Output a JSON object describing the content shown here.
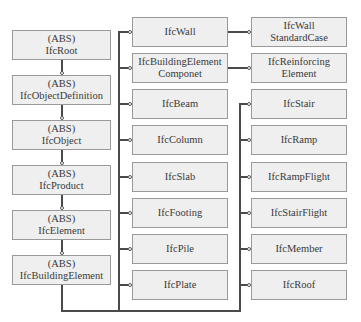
{
  "diagram": {
    "left_column": [
      {
        "tag": "(ABS)",
        "name": "IfcRoot"
      },
      {
        "tag": "(ABS)",
        "name": "IfcObjectDefinition"
      },
      {
        "tag": "(ABS)",
        "name": "IfcObject"
      },
      {
        "tag": "(ABS)",
        "name": "IfcProduct"
      },
      {
        "tag": "(ABS)",
        "name": "IfcElement"
      },
      {
        "tag": "(ABS)",
        "name": "IfcBuildingElement"
      }
    ],
    "middle_column": [
      {
        "line1": "IfcWall",
        "line2": ""
      },
      {
        "line1": "IfcBuildingElement",
        "line2": "Componet"
      },
      {
        "line1": "IfcBeam",
        "line2": ""
      },
      {
        "line1": "IfcColumn",
        "line2": ""
      },
      {
        "line1": "IfcSlab",
        "line2": ""
      },
      {
        "line1": "IfcFooting",
        "line2": ""
      },
      {
        "line1": "IfcPile",
        "line2": ""
      },
      {
        "line1": "IfcPlate",
        "line2": ""
      }
    ],
    "right_column": [
      {
        "line1": "IfcWall",
        "line2": "StandardCase"
      },
      {
        "line1": "IfcReinforcing",
        "line2": "Element"
      },
      {
        "line1": "IfcStair",
        "line2": ""
      },
      {
        "line1": "IfcRamp",
        "line2": ""
      },
      {
        "line1": "IfcRampFlight",
        "line2": ""
      },
      {
        "line1": "IfcStairFlight",
        "line2": ""
      },
      {
        "line1": "IfcMember",
        "line2": ""
      },
      {
        "line1": "IfcRoof",
        "line2": ""
      }
    ],
    "colors": {
      "box_fill": "#efefef",
      "box_border": "#9a9a9a",
      "line": "#4a4a4a",
      "text": "#3a3a3a"
    }
  }
}
